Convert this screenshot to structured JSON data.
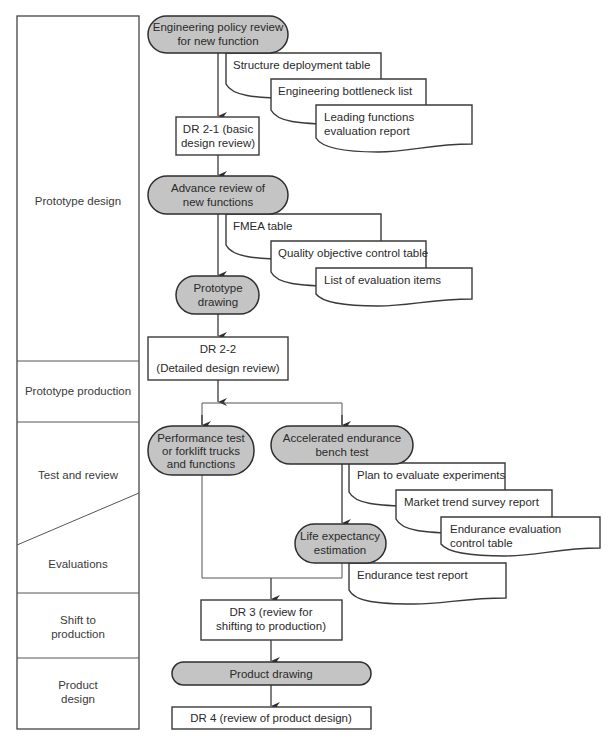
{
  "lanes": [
    {
      "label": "Prototype design"
    },
    {
      "label": "Prototype production"
    },
    {
      "label": "Test and review"
    },
    {
      "label": "Evaluations"
    },
    {
      "label": "Shift to production",
      "lines": [
        "Shift to",
        "production"
      ]
    },
    {
      "label": "Product design",
      "lines": [
        "Product",
        "design"
      ]
    }
  ],
  "processes": {
    "policy_review": {
      "lines": [
        "Engineering policy review",
        "for new function"
      ]
    },
    "advance_review": {
      "lines": [
        "Advance review of",
        "new functions"
      ]
    },
    "prototype_drawing": {
      "lines": [
        "Prototype",
        "drawing"
      ]
    },
    "performance_test": {
      "lines": [
        "Performance test",
        "or forklift trucks",
        "and functions"
      ]
    },
    "accelerated_test": {
      "lines": [
        "Accelerated endurance",
        "bench test"
      ]
    },
    "life_expectancy": {
      "lines": [
        "Life expectancy",
        "estimation"
      ]
    },
    "product_drawing": {
      "lines": [
        "Product drawing"
      ]
    }
  },
  "reviews": {
    "dr21": {
      "lines": [
        "DR 2-1 (basic",
        "design review)"
      ]
    },
    "dr22": {
      "lines": [
        "DR 2-2",
        "(Detailed design review)"
      ]
    },
    "dr3": {
      "lines": [
        "DR 3 (review for",
        "shifting to production)"
      ]
    },
    "dr4": {
      "lines": [
        "DR 4 (review of product design)"
      ]
    }
  },
  "documents": {
    "group1": [
      {
        "lines": [
          "Structure deployment table"
        ]
      },
      {
        "lines": [
          "Engineering bottleneck list"
        ]
      },
      {
        "lines": [
          "Leading functions",
          "evaluation report"
        ]
      }
    ],
    "group2": [
      {
        "lines": [
          "FMEA table"
        ]
      },
      {
        "lines": [
          "Quality objective control table"
        ]
      },
      {
        "lines": [
          "List of evaluation items"
        ]
      }
    ],
    "group3": [
      {
        "lines": [
          "Plan to evaluate experiments"
        ]
      },
      {
        "lines": [
          "Market trend survey report"
        ]
      },
      {
        "lines": [
          "Endurance evaluation",
          "control table"
        ]
      }
    ],
    "group4": [
      {
        "lines": [
          "Endurance test report"
        ]
      }
    ]
  },
  "colors": {
    "process_fill": "#c4c4c4",
    "stroke": "#2e2e2e",
    "background": "#ffffff"
  }
}
